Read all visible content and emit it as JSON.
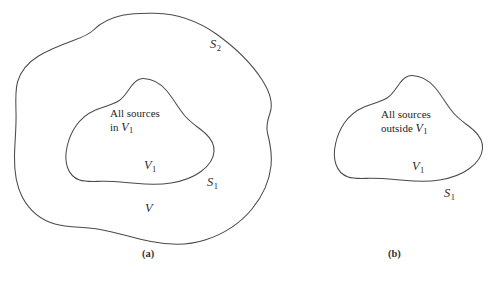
{
  "figure": {
    "background_color": "#ffffff",
    "line_color": "#4a4a4a",
    "text_color": "#2e2e2e",
    "panels": [
      {
        "id": "a",
        "caption": "(a)",
        "regions": [
          {
            "name": "outer-volume",
            "surface_label": "S",
            "surface_subscript": "2",
            "volume_label": "V",
            "volume_subscript": ""
          },
          {
            "name": "inner-volume",
            "surface_label": "S",
            "surface_subscript": "1",
            "volume_label": "V",
            "volume_subscript": "1"
          }
        ],
        "note_line1": "All sources",
        "note_line2_prefix": "in",
        "note_line2_symbol": "V",
        "note_line2_subscript": "1"
      },
      {
        "id": "b",
        "caption": "(b)",
        "regions": [
          {
            "name": "inner-volume",
            "surface_label": "S",
            "surface_subscript": "1",
            "volume_label": "V",
            "volume_subscript": "1"
          }
        ],
        "note_line1": "All sources",
        "note_line2_prefix": "outside",
        "note_line2_symbol": "V",
        "note_line2_subscript": "1"
      }
    ],
    "labels": {
      "panel_a_S2": "S",
      "panel_a_S2_sub": "2",
      "panel_a_S1": "S",
      "panel_a_S1_sub": "1",
      "panel_a_V1": "V",
      "panel_a_V1_sub": "1",
      "panel_a_V": "V",
      "panel_b_S1": "S",
      "panel_b_S1_sub": "1",
      "panel_b_V1": "V",
      "panel_b_V1_sub": "1"
    },
    "captions": {
      "a": "(a)",
      "b": "(b)"
    },
    "bottom_edge_text": ""
  }
}
